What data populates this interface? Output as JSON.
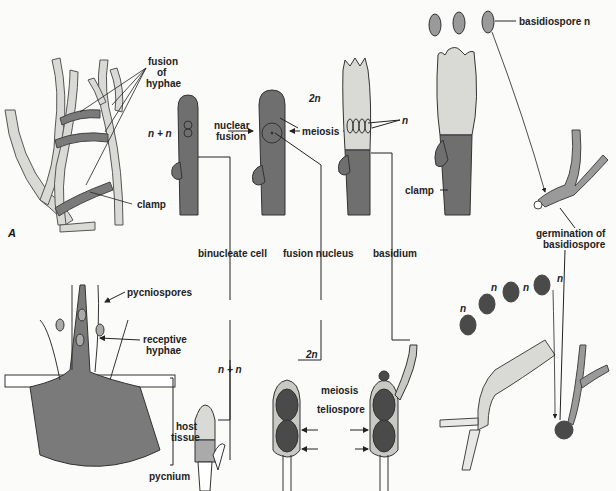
{
  "figure": {
    "panels": [
      "A",
      "B"
    ],
    "labels": {
      "fusion_of_hyphae": "fusion\nof\nhyphae",
      "fusion_of": "fusion",
      "of": "of",
      "hyphae": "hyphae",
      "clamp_a": "clamp",
      "n_plus_n_top": "n + n",
      "nuclear": "nuclear",
      "fusion": "fusion",
      "two_n_top": "2n",
      "meiosis_top": "meiosis",
      "n_meiosis": "n",
      "basidiospore_n": "basidiospore n",
      "clamp_b": "clamp",
      "germination_of": "germination of",
      "basidiospore": "basidiospore",
      "binucleate_cell": "binucleate cell",
      "fusion_nucleus": "fusion nucleus",
      "basidium": "basidium",
      "pycniospores": "pycniospores",
      "receptive": "receptive",
      "hyphae_b": "hyphae",
      "host": "host",
      "tissue": "tissue",
      "pycnium": "pycnium",
      "n_plus_n_bottom": "n + n",
      "two_n_bottom": "2n",
      "meiosis_bottom": "meiosis",
      "teliospore": "teliospore",
      "n1": "n",
      "n2": "n",
      "n3": "n",
      "n4": "n"
    },
    "colors": {
      "dark_cell": "#6f6f6f",
      "light_cell": "#d9d9d6",
      "line": "#222222",
      "teliospore": "#4a4a4a"
    }
  }
}
